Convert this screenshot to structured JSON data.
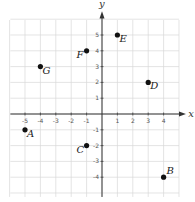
{
  "chart_data": {
    "type": "scatter",
    "title": "",
    "xlabel": "x",
    "ylabel": "y",
    "xlim": [
      -6,
      5
    ],
    "ylim": [
      -5,
      6
    ],
    "grid": true,
    "x_ticks": [
      -5,
      -4,
      -3,
      -2,
      -1,
      1,
      2,
      3,
      4
    ],
    "y_ticks": [
      5,
      4,
      3,
      2,
      1,
      -1,
      -2,
      -3,
      -4
    ],
    "points": [
      {
        "label": "A",
        "x": -5,
        "y": -1
      },
      {
        "label": "B",
        "x": 4,
        "y": -4
      },
      {
        "label": "C",
        "x": -1,
        "y": -2
      },
      {
        "label": "D",
        "x": 3,
        "y": 2
      },
      {
        "label": "E",
        "x": 1,
        "y": 5
      },
      {
        "label": "F",
        "x": -1,
        "y": 4
      },
      {
        "label": "G",
        "x": -4,
        "y": 3
      }
    ]
  },
  "colors": {
    "grid": "#d9d9d9",
    "axis": "#333333",
    "point": "#111111"
  }
}
